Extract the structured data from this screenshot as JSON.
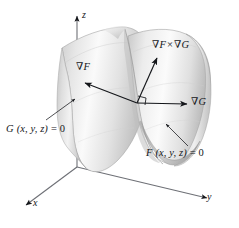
{
  "figure": {
    "type": "3d-vector-diagram",
    "background_color": "#ffffff",
    "ink_color": "#14161a",
    "surface_light": "#fcfcfc",
    "surface_mid": "#d9d9d9",
    "surface_dark": "#a9a9a9",
    "axes": {
      "z_label": "z",
      "x_label": "x",
      "y_label": "y",
      "origin_px": [
        77,
        167
      ]
    },
    "vectors": [
      {
        "id": "grad-F",
        "label_nabla": "∇",
        "label_symbol": "F",
        "label_full": "∇F",
        "direction": "up-left",
        "tail_px": [
          137,
          103
        ],
        "head_px": [
          83,
          82
        ]
      },
      {
        "id": "grad-G",
        "label_nabla": "∇",
        "label_symbol": "G",
        "label_full": "∇G",
        "direction": "right",
        "tail_px": [
          137,
          103
        ],
        "head_px": [
          188,
          104
        ]
      },
      {
        "id": "grad-F-cross-grad-G",
        "label_nabla_1": "∇",
        "label_symbol_1": "F",
        "label_times": "×",
        "label_nabla_2": "∇",
        "label_symbol_2": "G",
        "label_full": "∇F × ∇G",
        "direction": "up-right",
        "tail_px": [
          137,
          103
        ],
        "head_px": [
          157,
          57
        ]
      }
    ],
    "right_angle_marker": {
      "present": true,
      "at_px": [
        137,
        103
      ]
    },
    "surfaces": [
      {
        "id": "surface-G",
        "label_symbol": "G",
        "label_args": "(x, y, z)",
        "label_equals": "= 0",
        "label_full": "G (x, y, z) = 0",
        "label_pos_px": [
          8,
          122
        ],
        "leader_from_px": [
          48,
          120
        ],
        "leader_to_px": [
          78,
          100
        ]
      },
      {
        "id": "surface-F",
        "label_symbol": "F",
        "label_args": "(x, y, z)",
        "label_equals": "= 0",
        "label_full": "F (x, y, z) = 0",
        "label_pos_px": [
          148,
          146
        ],
        "leader_from_px": [
          186,
          144
        ],
        "leader_to_px": [
          165,
          124
        ]
      }
    ],
    "dashed_segment": {
      "present": true,
      "description": "hidden z-axis behind surface"
    }
  }
}
